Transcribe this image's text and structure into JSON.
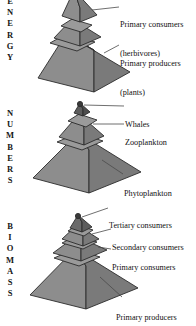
{
  "figure": {
    "background_color": "#ffffff",
    "pyramid_fill_left": "#8d8d8d",
    "pyramid_fill_right": "#7a7a7a",
    "pyramid_stroke": "#2b2b2b",
    "leader_line_color": "#4a4a4a",
    "text_color": "#111111"
  },
  "panels": [
    {
      "id": "energy",
      "axis_label": "E\nN\nE\nR\nG\nY",
      "axis_label_text": "ENERGY",
      "tiers": 3,
      "apex_cropped": true,
      "callouts": [
        {
          "id": "primary-consumers",
          "line1": "Primary consumers",
          "line2": "(herbivores)"
        },
        {
          "id": "primary-producers",
          "line1": "Primary producers",
          "line2": "(plants)"
        }
      ]
    },
    {
      "id": "numbers",
      "axis_label": "N\nU\nM\nB\nE\nR\nS",
      "axis_label_text": "NUMBERS",
      "tiers": 3,
      "apex_cropped": false,
      "callouts": [
        {
          "id": "whales",
          "line1": "Whales",
          "line2": ""
        },
        {
          "id": "zooplankton",
          "line1": "Zooplankton",
          "line2": ""
        },
        {
          "id": "phytoplankton",
          "line1": "Phytoplankton",
          "line2": ""
        }
      ]
    },
    {
      "id": "biomass",
      "axis_label": "B\nI\nO\nM\nA\nS\nS",
      "axis_label_text": "BIOMASS",
      "tiers": 4,
      "apex_cropped": false,
      "callouts": [
        {
          "id": "tertiary-consumers",
          "line1": "Tertiary consumers",
          "line2": ""
        },
        {
          "id": "secondary-consumers",
          "line1": "Secondary consumers",
          "line2": ""
        },
        {
          "id": "primary-consumers",
          "line1": "Primary consumers",
          "line2": ""
        },
        {
          "id": "primary-producers",
          "line1": "Primary producers",
          "line2": ""
        }
      ]
    }
  ]
}
